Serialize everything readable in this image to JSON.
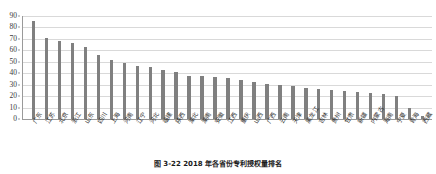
{
  "chart_data": {
    "type": "bar",
    "title": "",
    "xlabel": "",
    "ylabel": "",
    "ylim": [
      0,
      90
    ],
    "yticks": [
      0,
      10,
      20,
      30,
      40,
      50,
      60,
      70,
      80,
      90
    ],
    "grid": true,
    "legend": false,
    "bar_color": "#808080",
    "gridline_color": "#d9d9d9",
    "axis_color": "#9a9a9a",
    "categories": [
      "广东",
      "江苏",
      "北京",
      "浙江",
      "山东",
      "四川",
      "上海",
      "河南",
      "辽宁",
      "河北",
      "福建",
      "陕西",
      "湖北",
      "湖南",
      "安徽",
      "江西",
      "重庆",
      "山西",
      "广西",
      "云南",
      "天津",
      "黑龙江",
      "吉林",
      "贵州",
      "甘肃",
      "新疆",
      "内蒙古",
      "海南",
      "宁夏",
      "青海",
      "西藏"
    ],
    "values": [
      86,
      71,
      68.5,
      66,
      62.5,
      56,
      52,
      49,
      46.5,
      45.5,
      43,
      41.5,
      38,
      37.5,
      37,
      35.5,
      34,
      32.5,
      31,
      30,
      28.5,
      27.5,
      26.5,
      25.5,
      24.5,
      23.5,
      22.5,
      21.5,
      20.5,
      10,
      3
    ]
  },
  "caption": {
    "text": "图 3-22  2018 年各省份专利授权量排名"
  }
}
